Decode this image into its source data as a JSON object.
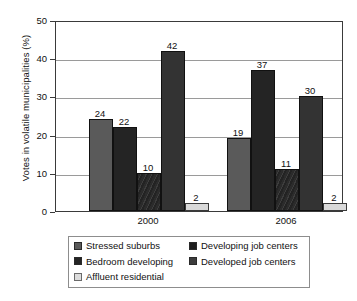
{
  "chart_data": {
    "type": "bar",
    "title": "",
    "xlabel": "",
    "ylabel": "Votes in volatile municipalities (%)",
    "categories": [
      "2000",
      "2006"
    ],
    "ylim": [
      0,
      50
    ],
    "yticks": [
      0,
      10,
      20,
      30,
      40,
      50
    ],
    "ytick_labels": [
      "0",
      "10",
      "20",
      "30",
      "40",
      "50"
    ],
    "grid": true,
    "legend_position": "below",
    "series": [
      {
        "name": "Stressed suburbs",
        "color": "#5a5a5a",
        "values": [
          24,
          19
        ],
        "value_labels": [
          "24",
          "19"
        ]
      },
      {
        "name": "Bedroom developing",
        "color": "#242424",
        "values": [
          22,
          37
        ],
        "value_labels": [
          "22",
          "37"
        ]
      },
      {
        "name": "Developing job centers",
        "color": "#2b2b2b",
        "values": [
          10,
          11
        ],
        "value_labels": [
          "10",
          "11"
        ]
      },
      {
        "name": "Developed job centers",
        "color": "#333333",
        "values": [
          42,
          30
        ],
        "value_labels": [
          "42",
          "30"
        ]
      },
      {
        "name": "Affluent residential",
        "color": "#d9d9d9",
        "values": [
          2,
          2
        ],
        "value_labels": [
          "2",
          "2"
        ]
      }
    ]
  },
  "legend": {
    "entries": [
      {
        "label": "Stressed suburbs",
        "swatch": "s0"
      },
      {
        "label": "Developing job centers",
        "swatch": "s2"
      },
      {
        "label": "Bedroom developing",
        "swatch": "s1"
      },
      {
        "label": "Developed job centers",
        "swatch": "s3"
      },
      {
        "label": "Affluent residential",
        "swatch": "s4"
      }
    ]
  }
}
